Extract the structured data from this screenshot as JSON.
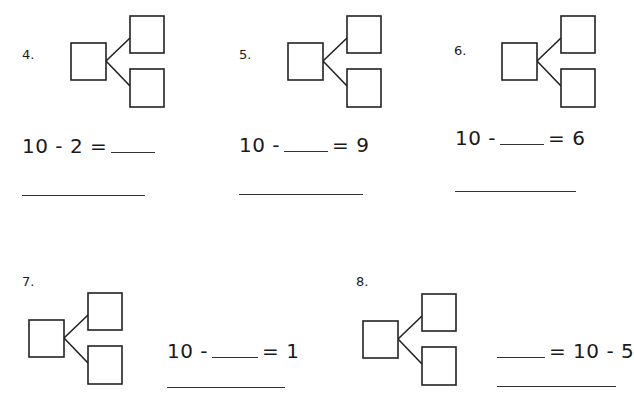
{
  "problems": [
    {
      "number": "4.",
      "equation_left": "10 - 2 =",
      "equation_right": "",
      "blank_position": "end"
    },
    {
      "number": "5.",
      "equation_left": "10 -",
      "equation_right": "= 9",
      "blank_position": "middle"
    },
    {
      "number": "6.",
      "equation_left": "10 -",
      "equation_right": "= 6",
      "blank_position": "middle"
    },
    {
      "number": "7.",
      "equation_left": "10 -",
      "equation_right": "= 1",
      "blank_position": "middle"
    },
    {
      "number": "8.",
      "equation_left": "",
      "equation_right": "= 10 - 5",
      "blank_position": "start"
    }
  ]
}
